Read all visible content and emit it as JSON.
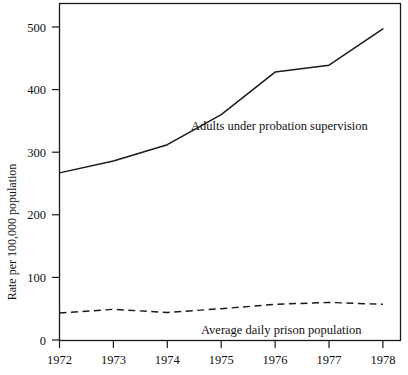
{
  "chart_data": {
    "type": "line",
    "title": "",
    "subtitle": "",
    "xlabel": "",
    "ylabel": "Rate per 100,000 population",
    "x": [
      1972,
      1973,
      1974,
      1975,
      1976,
      1977,
      1978
    ],
    "xtick_labels": [
      "1972",
      "1973",
      "1974",
      "1975",
      "1976",
      "1977",
      "1978"
    ],
    "ytick_labels": [
      "0",
      "100",
      "200",
      "300",
      "400",
      "500"
    ],
    "yticks": [
      0,
      100,
      200,
      300,
      400,
      500
    ],
    "xlim": [
      1972,
      1978
    ],
    "ylim": [
      0,
      550
    ],
    "grid": false,
    "legend_position": "inline-annotation",
    "series": [
      {
        "name": "Adults under probation supervision",
        "style": "solid",
        "color": "#1a1a1a",
        "values": [
          267,
          286,
          312,
          360,
          428,
          439,
          497
        ],
        "annotation": "Adults under probation supervision"
      },
      {
        "name": "Average daily prison population",
        "style": "dashed",
        "color": "#1a1a1a",
        "values": [
          43,
          49,
          44,
          50,
          57,
          60,
          57
        ],
        "annotation": "Average daily prison population"
      }
    ],
    "annotations": [
      {
        "text": "Adults under probation supervision",
        "for_series": "Adults under probation supervision"
      },
      {
        "text": "Average daily prison population",
        "for_series": "Average daily prison population"
      }
    ]
  }
}
